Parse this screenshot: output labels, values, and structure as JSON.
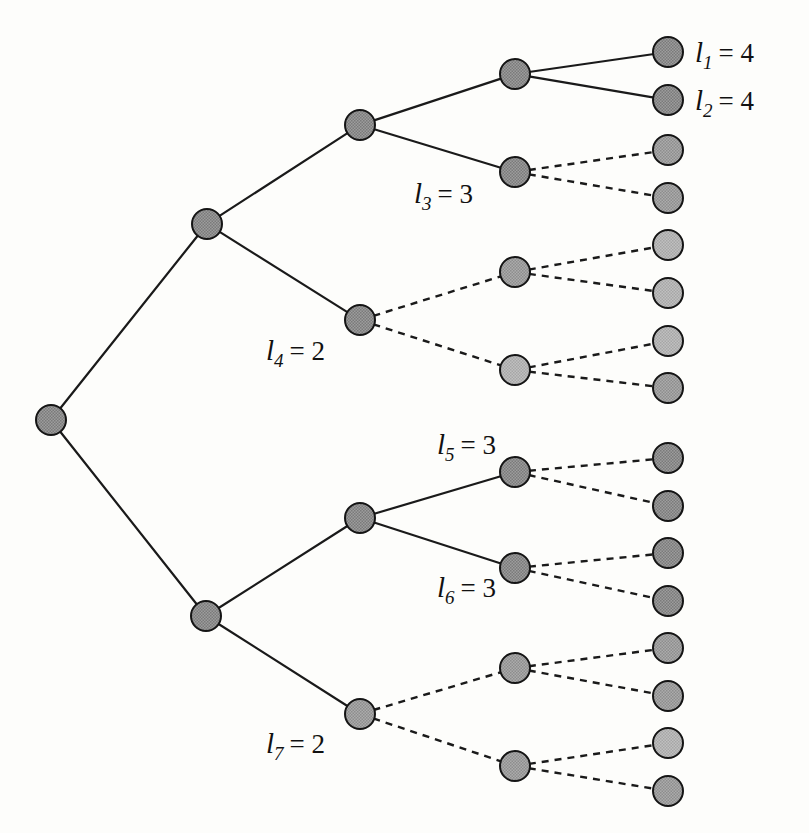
{
  "figure": {
    "background_color": "#fdfdfb",
    "node_fill_dark": "#8c8c8c",
    "node_fill_mid": "#9a9a9a",
    "node_fill_light": "#b4b4b4",
    "edge_color": "#1a1a1a",
    "text_color": "#111111"
  },
  "labels": [
    {
      "id": "l1",
      "symbol": "l",
      "subscript": "1",
      "relation": "=",
      "value": "4",
      "text": "l1 = 4",
      "x": 695,
      "y": 62
    },
    {
      "id": "l2",
      "symbol": "l",
      "subscript": "2",
      "relation": "=",
      "value": "4",
      "text": "l2 = 4",
      "x": 695,
      "y": 110
    },
    {
      "id": "l3",
      "symbol": "l",
      "subscript": "3",
      "relation": "=",
      "value": "3",
      "text": "l3 = 3",
      "x": 414,
      "y": 203
    },
    {
      "id": "l4",
      "symbol": "l",
      "subscript": "4",
      "relation": "=",
      "value": "2",
      "text": "l4 = 2",
      "x": 266,
      "y": 360
    },
    {
      "id": "l5",
      "symbol": "l",
      "subscript": "5",
      "relation": "=",
      "value": "3",
      "text": "l5 = 3",
      "x": 437,
      "y": 454
    },
    {
      "id": "l6",
      "symbol": "l",
      "subscript": "6",
      "relation": "=",
      "value": "3",
      "text": "l6 = 3",
      "x": 437,
      "y": 597
    },
    {
      "id": "l7",
      "symbol": "l",
      "subscript": "7",
      "relation": "=",
      "value": "2",
      "text": "l7 = 2",
      "x": 266,
      "y": 753
    }
  ],
  "chart_data": {
    "type": "diagram",
    "diagram_kind": "binary-tree",
    "depth_columns_x": [
      51,
      207,
      360,
      515,
      668
    ],
    "node_radius": 15,
    "nodes": [
      {
        "id": "root",
        "depth": 0,
        "x": 51,
        "y": 420,
        "shade": "dark",
        "kind": "internal"
      },
      {
        "id": "n-top",
        "depth": 1,
        "x": 207,
        "y": 224,
        "shade": "dark",
        "kind": "internal"
      },
      {
        "id": "n-bot",
        "depth": 1,
        "x": 206,
        "y": 616,
        "shade": "dark",
        "kind": "internal"
      },
      {
        "id": "n-a",
        "depth": 2,
        "x": 360,
        "y": 125,
        "shade": "dark",
        "kind": "internal"
      },
      {
        "id": "n-l4",
        "depth": 2,
        "x": 360,
        "y": 320,
        "shade": "dark",
        "kind": "leaf-codeword",
        "label": "l4"
      },
      {
        "id": "n-b",
        "depth": 2,
        "x": 360,
        "y": 518,
        "shade": "dark",
        "kind": "internal"
      },
      {
        "id": "n-l7",
        "depth": 2,
        "x": 360,
        "y": 714,
        "shade": "mid",
        "kind": "leaf-codeword",
        "label": "l7"
      },
      {
        "id": "n-c",
        "depth": 3,
        "x": 515,
        "y": 74,
        "shade": "dark",
        "kind": "internal"
      },
      {
        "id": "n-l3",
        "depth": 3,
        "x": 515,
        "y": 172,
        "shade": "dark",
        "kind": "leaf-codeword",
        "label": "l3"
      },
      {
        "id": "n-d",
        "depth": 3,
        "x": 515,
        "y": 272,
        "shade": "mid",
        "kind": "phantom"
      },
      {
        "id": "n-e",
        "depth": 3,
        "x": 515,
        "y": 370,
        "shade": "light",
        "kind": "phantom"
      },
      {
        "id": "n-l5",
        "depth": 3,
        "x": 515,
        "y": 472,
        "shade": "dark",
        "kind": "leaf-codeword",
        "label": "l5"
      },
      {
        "id": "n-l6",
        "depth": 3,
        "x": 515,
        "y": 568,
        "shade": "dark",
        "kind": "leaf-codeword",
        "label": "l6"
      },
      {
        "id": "n-f",
        "depth": 3,
        "x": 515,
        "y": 668,
        "shade": "mid",
        "kind": "phantom"
      },
      {
        "id": "n-g",
        "depth": 3,
        "x": 515,
        "y": 766,
        "shade": "mid",
        "kind": "phantom"
      },
      {
        "id": "leaf-1",
        "depth": 4,
        "x": 668,
        "y": 52,
        "shade": "dark",
        "kind": "leaf",
        "label": "l1"
      },
      {
        "id": "leaf-2",
        "depth": 4,
        "x": 668,
        "y": 100,
        "shade": "dark",
        "kind": "leaf",
        "label": "l2"
      },
      {
        "id": "leaf-3",
        "depth": 4,
        "x": 668,
        "y": 150,
        "shade": "mid",
        "kind": "leaf"
      },
      {
        "id": "leaf-4",
        "depth": 4,
        "x": 668,
        "y": 198,
        "shade": "mid",
        "kind": "leaf"
      },
      {
        "id": "leaf-5",
        "depth": 4,
        "x": 668,
        "y": 245,
        "shade": "light",
        "kind": "leaf"
      },
      {
        "id": "leaf-6",
        "depth": 4,
        "x": 668,
        "y": 293,
        "shade": "light",
        "kind": "leaf"
      },
      {
        "id": "leaf-7",
        "depth": 4,
        "x": 668,
        "y": 341,
        "shade": "light",
        "kind": "leaf"
      },
      {
        "id": "leaf-8",
        "depth": 4,
        "x": 668,
        "y": 388,
        "shade": "mid",
        "kind": "leaf"
      },
      {
        "id": "leaf-9",
        "depth": 4,
        "x": 668,
        "y": 458,
        "shade": "dark",
        "kind": "leaf"
      },
      {
        "id": "leaf-10",
        "depth": 4,
        "x": 668,
        "y": 506,
        "shade": "dark",
        "kind": "leaf"
      },
      {
        "id": "leaf-11",
        "depth": 4,
        "x": 668,
        "y": 553,
        "shade": "dark",
        "kind": "leaf"
      },
      {
        "id": "leaf-12",
        "depth": 4,
        "x": 668,
        "y": 601,
        "shade": "dark",
        "kind": "leaf"
      },
      {
        "id": "leaf-13",
        "depth": 4,
        "x": 668,
        "y": 648,
        "shade": "mid",
        "kind": "leaf"
      },
      {
        "id": "leaf-14",
        "depth": 4,
        "x": 668,
        "y": 696,
        "shade": "mid",
        "kind": "leaf"
      },
      {
        "id": "leaf-15",
        "depth": 4,
        "x": 668,
        "y": 743,
        "shade": "light",
        "kind": "leaf"
      },
      {
        "id": "leaf-16",
        "depth": 4,
        "x": 668,
        "y": 791,
        "shade": "mid",
        "kind": "leaf"
      }
    ],
    "edges": [
      {
        "from": "root",
        "to": "n-top",
        "style": "solid"
      },
      {
        "from": "root",
        "to": "n-bot",
        "style": "solid"
      },
      {
        "from": "n-top",
        "to": "n-a",
        "style": "solid"
      },
      {
        "from": "n-top",
        "to": "n-l4",
        "style": "solid"
      },
      {
        "from": "n-bot",
        "to": "n-b",
        "style": "solid"
      },
      {
        "from": "n-bot",
        "to": "n-l7",
        "style": "solid"
      },
      {
        "from": "n-a",
        "to": "n-c",
        "style": "solid"
      },
      {
        "from": "n-a",
        "to": "n-l3",
        "style": "solid"
      },
      {
        "from": "n-l4",
        "to": "n-d",
        "style": "dashed"
      },
      {
        "from": "n-l4",
        "to": "n-e",
        "style": "dashed"
      },
      {
        "from": "n-b",
        "to": "n-l5",
        "style": "solid"
      },
      {
        "from": "n-b",
        "to": "n-l6",
        "style": "solid"
      },
      {
        "from": "n-l7",
        "to": "n-f",
        "style": "dashed"
      },
      {
        "from": "n-l7",
        "to": "n-g",
        "style": "dashed"
      },
      {
        "from": "n-c",
        "to": "leaf-1",
        "style": "solid"
      },
      {
        "from": "n-c",
        "to": "leaf-2",
        "style": "solid"
      },
      {
        "from": "n-l3",
        "to": "leaf-3",
        "style": "dashed"
      },
      {
        "from": "n-l3",
        "to": "leaf-4",
        "style": "dashed"
      },
      {
        "from": "n-d",
        "to": "leaf-5",
        "style": "dashed"
      },
      {
        "from": "n-d",
        "to": "leaf-6",
        "style": "dashed"
      },
      {
        "from": "n-e",
        "to": "leaf-7",
        "style": "dashed"
      },
      {
        "from": "n-e",
        "to": "leaf-8",
        "style": "dashed"
      },
      {
        "from": "n-l5",
        "to": "leaf-9",
        "style": "dashed"
      },
      {
        "from": "n-l5",
        "to": "leaf-10",
        "style": "dashed"
      },
      {
        "from": "n-l6",
        "to": "leaf-11",
        "style": "dashed"
      },
      {
        "from": "n-l6",
        "to": "leaf-12",
        "style": "dashed"
      },
      {
        "from": "n-f",
        "to": "leaf-13",
        "style": "dashed"
      },
      {
        "from": "n-f",
        "to": "leaf-14",
        "style": "dashed"
      },
      {
        "from": "n-g",
        "to": "leaf-15",
        "style": "dashed"
      },
      {
        "from": "n-g",
        "to": "leaf-16",
        "style": "dashed"
      }
    ],
    "annotations": [
      {
        "text": "l1 = 4",
        "attached_to": "leaf-1"
      },
      {
        "text": "l2 = 4",
        "attached_to": "leaf-2"
      },
      {
        "text": "l3 = 3",
        "attached_to": "n-l3"
      },
      {
        "text": "l4 = 2",
        "attached_to": "n-l4"
      },
      {
        "text": "l5 = 3",
        "attached_to": "n-l5"
      },
      {
        "text": "l6 = 3",
        "attached_to": "n-l6"
      },
      {
        "text": "l7 = 2",
        "attached_to": "n-l7"
      }
    ]
  }
}
